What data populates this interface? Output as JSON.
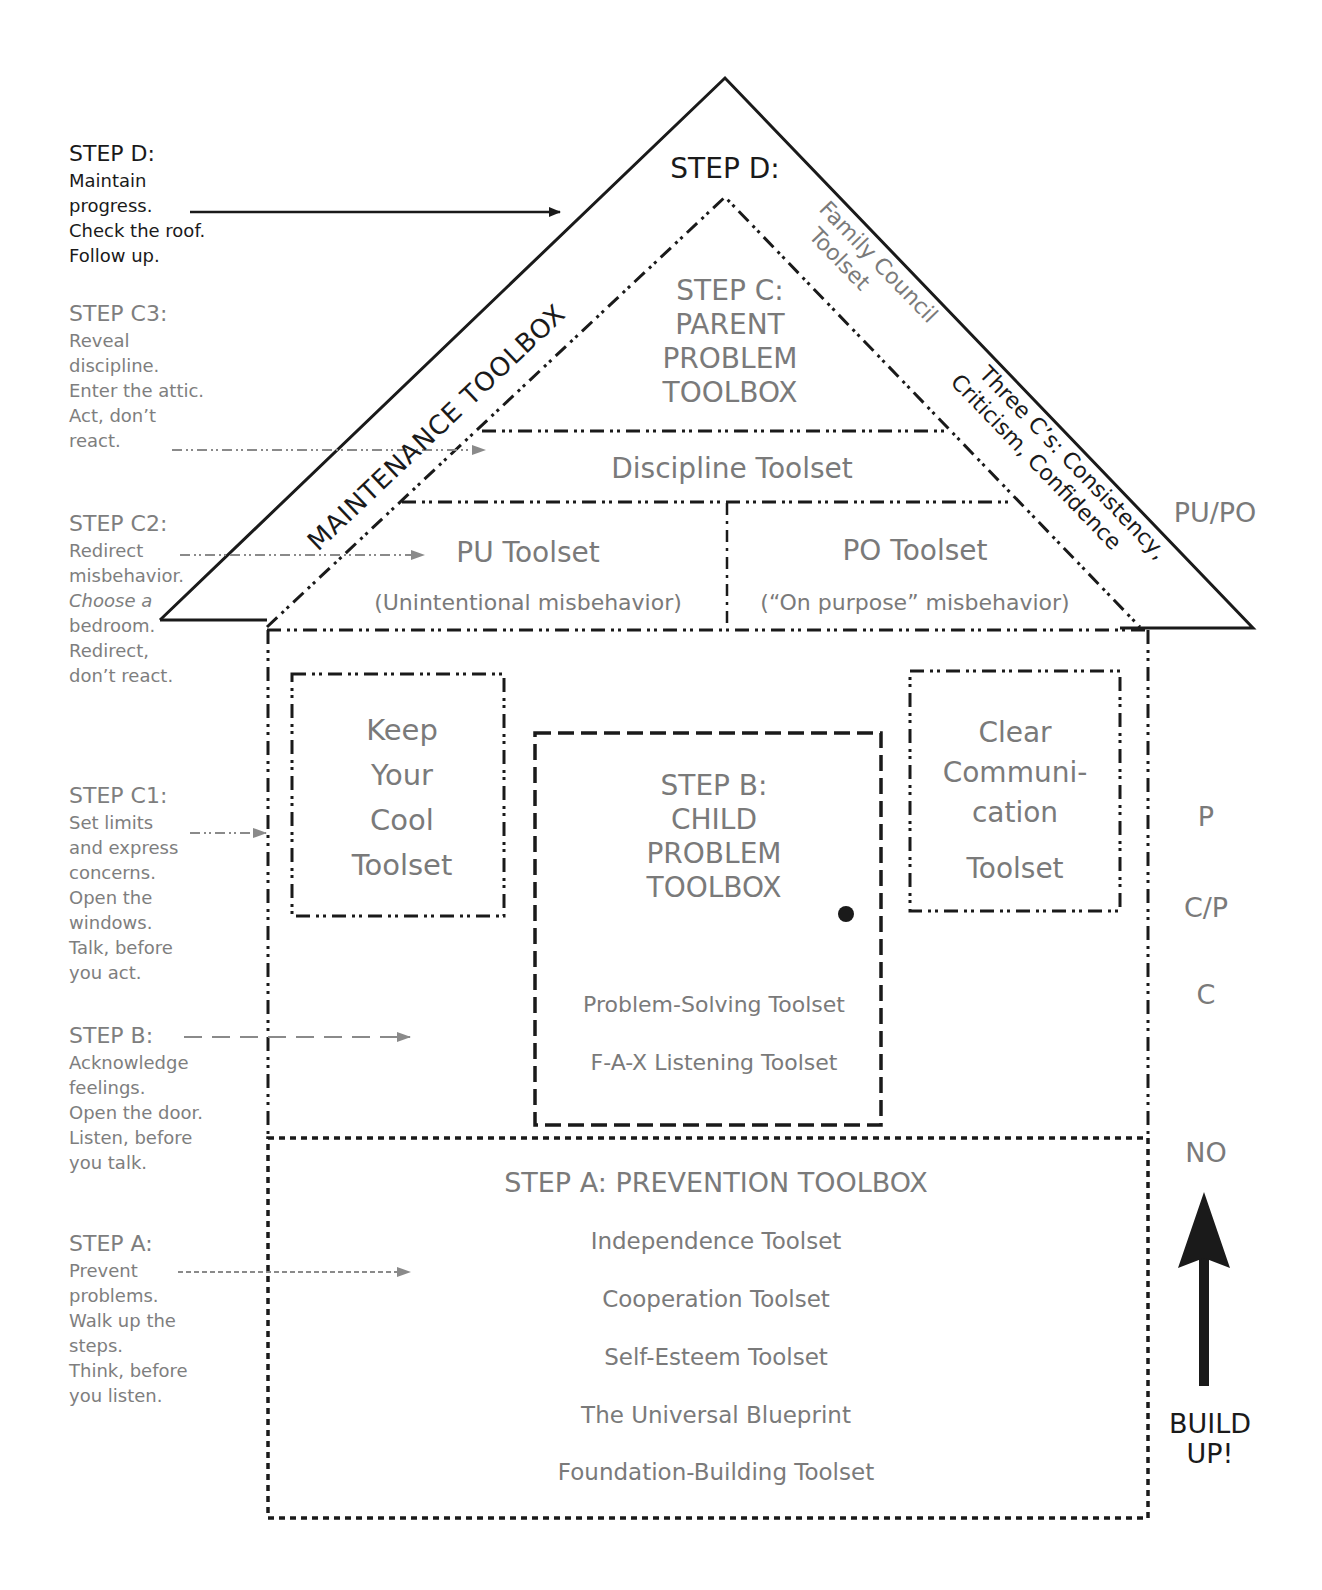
{
  "diagram": {
    "colors": {
      "ink": "#1a1a1a",
      "gray_text": "#7a7a7a",
      "background": "#ffffff"
    }
  },
  "left_annotations": [
    {
      "id": "step-d",
      "heading": "STEP D:",
      "lines": [
        "Maintain",
        "progress.",
        "Check the roof.",
        "Follow up."
      ],
      "color": "#1a1a1a",
      "arrow_style": "solid"
    },
    {
      "id": "step-c3",
      "heading": "STEP C3:",
      "first_letter": "R",
      "lines": [
        "Reveal",
        "discipline.",
        "Enter the attic.",
        "Act, don’t",
        "react."
      ],
      "color": "#7e7e7e",
      "arrow_style": "dash-dot-dot"
    },
    {
      "id": "step-c2",
      "heading": "STEP C2:",
      "first_letter": "R",
      "lines": [
        "Redirect",
        "misbehavior.",
        "Choose a",
        "bedroom.",
        "Redirect,",
        "don’t react."
      ],
      "italic_word": "Choose",
      "color": "#7e7e7e",
      "arrow_style": "dash-dot-dot"
    },
    {
      "id": "step-c1",
      "heading": "STEP C1:",
      "first_letter": "S",
      "lines": [
        "Set limits",
        "and express",
        "concerns.",
        "Open the",
        "windows.",
        "Talk, before",
        "you act."
      ],
      "color": "#7e7e7e",
      "arrow_style": "dash-dot-dot"
    },
    {
      "id": "step-b",
      "heading": "STEP B:",
      "first_letter": "A",
      "lines": [
        "Acknowledge",
        "feelings.",
        "Open the door.",
        "Listen, before",
        "you talk."
      ],
      "color": "#7e7e7e",
      "arrow_style": "long-dash"
    },
    {
      "id": "step-a",
      "heading": "STEP A:",
      "first_letter": "P",
      "lines": [
        "Prevent",
        "problems.",
        "Walk up the",
        "steps.",
        "Think, before",
        "you listen."
      ],
      "color": "#7e7e7e",
      "arrow_style": "short-dash"
    }
  ],
  "roof": {
    "step_d_label": "STEP D:",
    "maintenance_label": "MAINTENANCE TOOLBOX",
    "family_council": [
      "Family Council",
      "Toolset"
    ],
    "three_cs": [
      "Three C’s: Consistency,",
      "Criticism, Confidence"
    ],
    "step_c": [
      "STEP C:",
      "PARENT",
      "PROBLEM",
      "TOOLBOX"
    ],
    "discipline": "Discipline Toolset",
    "pu_title": "PU Toolset",
    "pu_sub": "(Unintentional misbehavior)",
    "po_title": "PO Toolset",
    "po_sub": "(“On purpose” misbehavior)"
  },
  "middle_floor": {
    "keep_cool": [
      "Keep",
      "Your",
      "Cool",
      "Toolset"
    ],
    "clear_comm": [
      "Clear",
      "Communi-",
      "cation",
      "Toolset"
    ],
    "step_b": [
      "STEP B:",
      "CHILD",
      "PROBLEM",
      "TOOLBOX"
    ],
    "door_tools": [
      "Problem-Solving Toolset",
      "F-A-X Listening Toolset"
    ]
  },
  "foundation": {
    "title": "STEP A: PREVENTION TOOLBOX",
    "tools": [
      "Independence Toolset",
      "Cooperation Toolset",
      "Self-Esteem Toolset",
      "The Universal Blueprint",
      "Foundation-Building Toolset"
    ]
  },
  "right_labels": {
    "pupo": "PU/PO",
    "p": "P",
    "cp": "C/P",
    "c": "C",
    "no": "NO",
    "build_up": [
      "BUILD",
      "UP!"
    ]
  }
}
